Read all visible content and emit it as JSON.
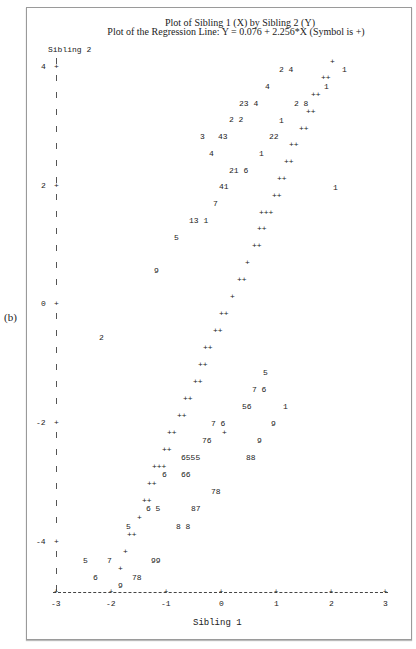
{
  "panel_label": "(b)",
  "chart_data": {
    "type": "scatter",
    "title": "Plot of Sibling 1 (X) by Sibling 2 (Y)",
    "subtitle": "Plot of the Regression Line: Y = 0.076 + 2.256*X (Symbol is +)",
    "xlabel": "Sibling 1",
    "ylabel": "Sibling 2",
    "xlim": [
      -3,
      3
    ],
    "ylim": [
      -5,
      4.5
    ],
    "x_ticks": [
      "-3",
      "-2",
      "-1",
      "0",
      "1",
      "2",
      "3"
    ],
    "y_ticks": [
      "4",
      "2",
      "0",
      "-2",
      "-4"
    ],
    "regression": {
      "intercept": 0.076,
      "slope": 2.256,
      "symbol": "+"
    },
    "grid": false,
    "legend": "Symbol is + (regression line); digits are plotting symbols for observations",
    "points_text": [
      {
        "t": "+",
        "x": 330,
        "y": 62
      },
      {
        "t": "2 4",
        "x": 279,
        "y": 70
      },
      {
        "t": "1",
        "x": 342,
        "y": 70
      },
      {
        "t": "++",
        "x": 321,
        "y": 78
      },
      {
        "t": "4",
        "x": 265,
        "y": 87
      },
      {
        "t": "1",
        "x": 324,
        "y": 87
      },
      {
        "t": "++",
        "x": 311,
        "y": 95
      },
      {
        "t": "23 4",
        "x": 239,
        "y": 104
      },
      {
        "t": "2 8",
        "x": 294,
        "y": 104
      },
      {
        "t": "++",
        "x": 306,
        "y": 112
      },
      {
        "t": "2 2",
        "x": 229,
        "y": 120
      },
      {
        "t": "1",
        "x": 279,
        "y": 121
      },
      {
        "t": "++",
        "x": 299,
        "y": 129
      },
      {
        "t": "3",
        "x": 200,
        "y": 137
      },
      {
        "t": "43",
        "x": 218,
        "y": 137
      },
      {
        "t": "22",
        "x": 269,
        "y": 137
      },
      {
        "t": "++",
        "x": 289,
        "y": 145
      },
      {
        "t": "4",
        "x": 209,
        "y": 154
      },
      {
        "t": "1",
        "x": 259,
        "y": 154
      },
      {
        "t": "++",
        "x": 284,
        "y": 162
      },
      {
        "t": "21 6",
        "x": 229,
        "y": 171
      },
      {
        "t": "++",
        "x": 277,
        "y": 179
      },
      {
        "t": "41",
        "x": 219,
        "y": 187
      },
      {
        "t": "1",
        "x": 333,
        "y": 188
      },
      {
        "t": "++",
        "x": 272,
        "y": 196
      },
      {
        "t": "7",
        "x": 213,
        "y": 204
      },
      {
        "t": "+++",
        "x": 259,
        "y": 213
      },
      {
        "t": "13 1",
        "x": 189,
        "y": 221
      },
      {
        "t": "++",
        "x": 257,
        "y": 229
      },
      {
        "t": "5",
        "x": 174,
        "y": 238
      },
      {
        "t": "++",
        "x": 252,
        "y": 246
      },
      {
        "t": "+",
        "x": 245,
        "y": 263
      },
      {
        "t": "9",
        "x": 154,
        "y": 271
      },
      {
        "t": "++",
        "x": 237,
        "y": 280
      },
      {
        "t": "+",
        "x": 230,
        "y": 297
      },
      {
        "t": "++",
        "x": 219,
        "y": 314
      },
      {
        "t": "++",
        "x": 213,
        "y": 331
      },
      {
        "t": "2",
        "x": 99,
        "y": 338
      },
      {
        "t": "++",
        "x": 203,
        "y": 348
      },
      {
        "t": "++",
        "x": 198,
        "y": 365
      },
      {
        "t": "5",
        "x": 263,
        "y": 373
      },
      {
        "t": "++",
        "x": 193,
        "y": 382
      },
      {
        "t": "7 6",
        "x": 252,
        "y": 390
      },
      {
        "t": "++",
        "x": 183,
        "y": 399
      },
      {
        "t": "56",
        "x": 242,
        "y": 407
      },
      {
        "t": "1",
        "x": 283,
        "y": 407
      },
      {
        "t": "++",
        "x": 177,
        "y": 416
      },
      {
        "t": "7 6",
        "x": 211,
        "y": 424
      },
      {
        "t": "9",
        "x": 271,
        "y": 424
      },
      {
        "t": "++",
        "x": 167,
        "y": 433
      },
      {
        "t": "+",
        "x": 222,
        "y": 433
      },
      {
        "t": "76",
        "x": 202,
        "y": 441
      },
      {
        "t": "9",
        "x": 257,
        "y": 441
      },
      {
        "t": "++",
        "x": 162,
        "y": 450
      },
      {
        "t": "6555",
        "x": 181,
        "y": 458
      },
      {
        "t": "88",
        "x": 246,
        "y": 458
      },
      {
        "t": "+++",
        "x": 152,
        "y": 467
      },
      {
        "t": "6",
        "x": 162,
        "y": 475
      },
      {
        "t": "66",
        "x": 181,
        "y": 475
      },
      {
        "t": "++",
        "x": 147,
        "y": 484
      },
      {
        "t": "78",
        "x": 211,
        "y": 492
      },
      {
        "t": "++",
        "x": 142,
        "y": 501
      },
      {
        "t": "6 5",
        "x": 146,
        "y": 509
      },
      {
        "t": "87",
        "x": 191,
        "y": 509
      },
      {
        "t": "+",
        "x": 137,
        "y": 518
      },
      {
        "t": "5",
        "x": 126,
        "y": 527
      },
      {
        "t": "8 8",
        "x": 176,
        "y": 527
      },
      {
        "t": "++",
        "x": 127,
        "y": 535
      },
      {
        "t": "+",
        "x": 123,
        "y": 552
      },
      {
        "t": "5",
        "x": 83,
        "y": 561
      },
      {
        "t": "7",
        "x": 107,
        "y": 561
      },
      {
        "t": "99",
        "x": 151,
        "y": 561
      },
      {
        "t": "+",
        "x": 118,
        "y": 569
      },
      {
        "t": "6",
        "x": 93,
        "y": 578
      },
      {
        "t": "78",
        "x": 132,
        "y": 578
      },
      {
        "t": "9",
        "x": 118,
        "y": 586
      }
    ]
  },
  "axis": {
    "y_tick_positions": [
      {
        "label": "4",
        "y": 67
      },
      {
        "label": "2",
        "y": 186
      },
      {
        "label": "0",
        "y": 304
      },
      {
        "label": "-2",
        "y": 423
      },
      {
        "label": "-4",
        "y": 542
      }
    ],
    "x_tick_positions": [
      {
        "label": "-3",
        "x": 56
      },
      {
        "label": "-2",
        "x": 111
      },
      {
        "label": "-1",
        "x": 166
      },
      {
        "label": "0",
        "x": 221
      },
      {
        "label": "1",
        "x": 276
      },
      {
        "label": "2",
        "x": 331
      },
      {
        "label": "3",
        "x": 385
      }
    ]
  }
}
